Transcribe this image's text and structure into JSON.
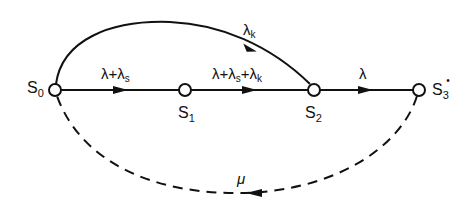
{
  "diagram": {
    "type": "state-transition-graph",
    "colors": {
      "stroke": "#111111",
      "background": "#ffffff"
    },
    "nodes": [
      {
        "id": "S0",
        "base": "S",
        "sub": "0",
        "mark": ""
      },
      {
        "id": "S1",
        "base": "S",
        "sub": "1",
        "mark": ""
      },
      {
        "id": "S2",
        "base": "S",
        "sub": "2",
        "mark": ""
      },
      {
        "id": "S3*",
        "base": "S",
        "sub": "3",
        "mark": "•"
      }
    ],
    "edges": [
      {
        "from": "S0",
        "to": "S1",
        "style": "solid",
        "label_main": "λ+λ",
        "label_sub": "s",
        "label_tail": ""
      },
      {
        "from": "S1",
        "to": "S2",
        "style": "solid",
        "label_main": "λ+λ",
        "label_sub": "s",
        "label_tail": "+λ",
        "label_tail_sub": "k"
      },
      {
        "from": "S2",
        "to": "S3*",
        "style": "solid",
        "label_main": "λ"
      },
      {
        "from": "S0",
        "to": "S2",
        "style": "solid-arc",
        "label_main": "λ",
        "label_sub": "k"
      },
      {
        "from": "S3*",
        "to": "S0",
        "style": "dashed-arc",
        "label_main": "μ"
      }
    ]
  }
}
